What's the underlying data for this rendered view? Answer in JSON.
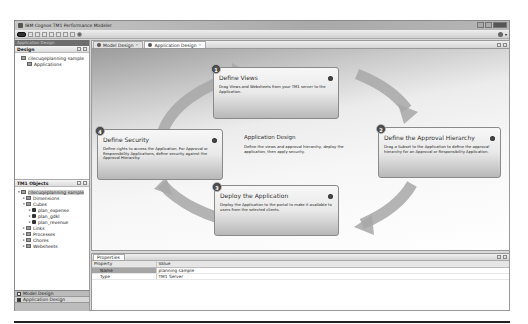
{
  "window": {
    "title": "IBM Cognos TM1 Performance Modeler"
  },
  "toolbar": {
    "buttons": [
      "home",
      "save",
      "undo",
      "redo",
      "new",
      "open",
      "refresh",
      "check",
      "settings"
    ],
    "help_label": "?"
  },
  "left_panel": {
    "perspective_header": "Application Design",
    "design_view": {
      "title": "Design",
      "tree": [
        {
          "label": "cilecuqeplanning sample",
          "level": 0,
          "icon": "folder-icon"
        },
        {
          "label": "Applications",
          "level": 1,
          "icon": "folder-icon"
        }
      ]
    },
    "objects_view": {
      "title": "TM1 Objects",
      "tree": [
        {
          "label": "cilecuqeplanning sample",
          "level": 0,
          "icon": "server-icon",
          "twisty": "▾",
          "selected": true
        },
        {
          "label": "Dimensions",
          "level": 1,
          "icon": "folder-icon",
          "twisty": "▸"
        },
        {
          "label": "Cubes",
          "level": 1,
          "icon": "folder-icon",
          "twisty": "▾"
        },
        {
          "label": "plan_expense",
          "level": 2,
          "icon": "cube-icon",
          "twisty": "▸"
        },
        {
          "label": "plan_gdkl",
          "level": 2,
          "icon": "cube-icon",
          "twisty": "▸"
        },
        {
          "label": "plan_revenue",
          "level": 2,
          "icon": "cube-icon",
          "twisty": "▸"
        },
        {
          "label": "Links",
          "level": 1,
          "icon": "folder-icon",
          "twisty": "▸"
        },
        {
          "label": "Processes",
          "level": 1,
          "icon": "folder-icon",
          "twisty": "▸"
        },
        {
          "label": "Chores",
          "level": 1,
          "icon": "folder-icon",
          "twisty": "▸"
        },
        {
          "label": "Websheets",
          "level": 1,
          "icon": "folder-icon",
          "twisty": "▸"
        }
      ]
    },
    "perspectives": [
      {
        "label": "Model Design",
        "active": false
      },
      {
        "label": "Application Design",
        "active": true
      }
    ]
  },
  "editor": {
    "tabs": [
      {
        "label": "Model Design",
        "active": false,
        "close": "×"
      },
      {
        "label": "Application Design",
        "active": true,
        "close": "×"
      }
    ],
    "center": {
      "title": "Application Design",
      "description": "Define the views and approval hierarchy, deploy the application, then apply security."
    },
    "steps": [
      {
        "number": "1",
        "title": "Define Views",
        "description": "Drag Views and Websheets from your TM1 server to the Application."
      },
      {
        "number": "2",
        "title": "Define the Approval Hierarchy",
        "description": "Drag a Subset to the Application to define the approval hierarchy for an Approval or Responsibility Application."
      },
      {
        "number": "3",
        "title": "Deploy the Application",
        "description": "Deploy the Application to the portal to make it available to users from the selected clients."
      },
      {
        "number": "4",
        "title": "Define Security",
        "description": "Define rights to access the Application. For Approval or Responsibility Applications, define security against the Approval Hierarchy."
      }
    ]
  },
  "properties": {
    "tab_label": "Properties",
    "columns": [
      "Property",
      "Value"
    ],
    "rows": [
      {
        "property": "Name",
        "value": "planning sample",
        "selected": true
      },
      {
        "property": "Type",
        "value": "TM1 Server",
        "selected": false
      }
    ]
  }
}
